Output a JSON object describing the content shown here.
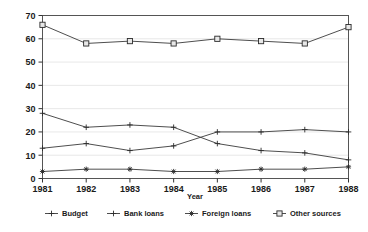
{
  "chart_data": {
    "type": "line",
    "title": "",
    "xlabel": "Year",
    "ylabel": "",
    "categories": [
      "1981",
      "1982",
      "1983",
      "1984",
      "1985",
      "1986",
      "1987",
      "1988"
    ],
    "x": [
      1981,
      1982,
      1983,
      1984,
      1985,
      1986,
      1987,
      1988
    ],
    "ylim": [
      0,
      70
    ],
    "yticks": [
      0,
      10,
      20,
      30,
      40,
      50,
      60,
      70
    ],
    "ytick_labels": [
      "0",
      "10",
      "20",
      "30",
      "40",
      "50",
      "60",
      "70"
    ],
    "grid": true,
    "legend_position": "bottom",
    "series": [
      {
        "name": "Budget",
        "marker": "plus",
        "values": [
          28,
          22,
          23,
          22,
          15,
          12,
          11,
          8
        ]
      },
      {
        "name": "Bank loans",
        "marker": "plus",
        "values": [
          13,
          15,
          12,
          14,
          20,
          20,
          21,
          20
        ]
      },
      {
        "name": "Foreign loans",
        "marker": "star",
        "values": [
          3,
          4,
          4,
          3,
          3,
          4,
          4,
          5
        ]
      },
      {
        "name": "Other sources",
        "marker": "square",
        "values": [
          66,
          58,
          59,
          58,
          60,
          59,
          58,
          65
        ]
      }
    ]
  },
  "legend": {
    "items": [
      {
        "label": "Budget",
        "marker": "plus"
      },
      {
        "label": "Bank loans",
        "marker": "plus"
      },
      {
        "label": "Foreign loans",
        "marker": "star"
      },
      {
        "label": "Other sources",
        "marker": "square"
      }
    ]
  },
  "colors": {
    "line": "#3a3a3a",
    "grid": "#dddddd",
    "frame": "#555555",
    "text": "#1a1a1a",
    "background": "#ffffff"
  }
}
